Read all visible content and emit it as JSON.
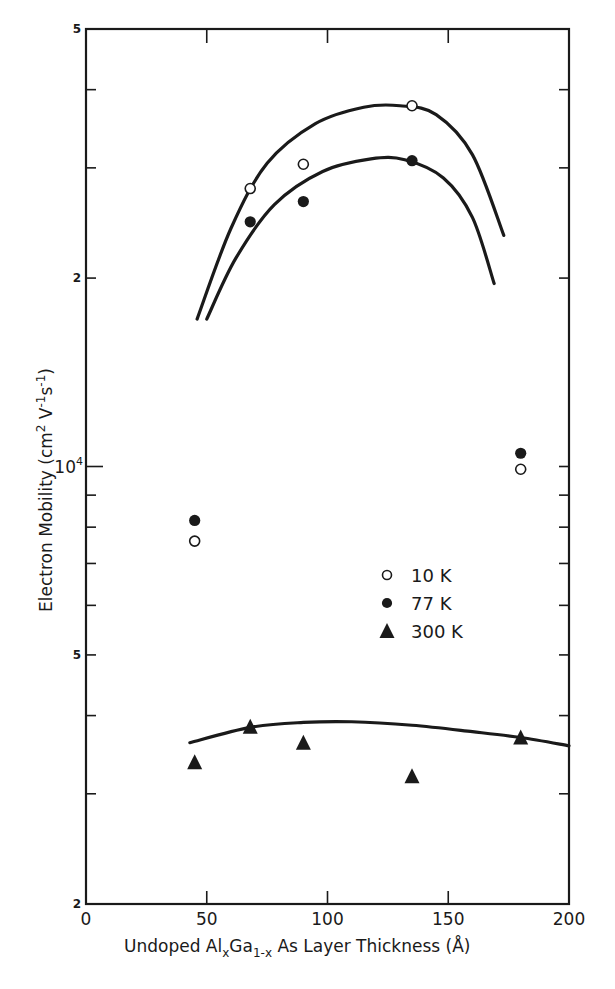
{
  "chart_data": {
    "type": "scatter",
    "title": "",
    "xlabel": "Undoped AlxGa1-x As Layer Thickness (Å)",
    "xlabel_parts": {
      "pre": "Undoped Al",
      "sub1": "x",
      "mid": "Ga",
      "sub2": "1-x",
      "post": " As Layer Thickness  (Å)"
    },
    "ylabel": "Electron Mobility (cm2 V-1s-1)",
    "ylabel_parts": {
      "pre": "Electron Mobility  (cm",
      "sup1": "2",
      "mid": " V",
      "sup2": "-1",
      "mid2": "s",
      "sup3": "-1",
      "post": ")"
    },
    "xlim": [
      0,
      200
    ],
    "ylim": [
      2000,
      50000
    ],
    "yscale": "log",
    "grid": false,
    "legend_position": "center-right",
    "x_ticks": [
      {
        "value": 0,
        "label": "0"
      },
      {
        "value": 50,
        "label": "50"
      },
      {
        "value": 100,
        "label": "100"
      },
      {
        "value": 150,
        "label": "150"
      },
      {
        "value": 200,
        "label": "200"
      }
    ],
    "y_ticks_labeled": [
      {
        "value": 50000,
        "label": "5"
      },
      {
        "value": 20000,
        "label": "2"
      },
      {
        "value": 10000,
        "label": "10",
        "sup": "4"
      },
      {
        "value": 5000,
        "label": "5"
      },
      {
        "value": 2000,
        "label": "2"
      }
    ],
    "y_minor_ticks": [
      40000,
      30000,
      9000,
      8000,
      7000,
      6000,
      4000,
      3000
    ],
    "series": [
      {
        "name": "10 K",
        "marker": "open-circle",
        "points": [
          {
            "x": 45,
            "y": 7600
          },
          {
            "x": 68,
            "y": 27800
          },
          {
            "x": 90,
            "y": 30400
          },
          {
            "x": 135,
            "y": 37700
          },
          {
            "x": 180,
            "y": 9900
          }
        ],
        "fit_curve": [
          [
            46,
            17200
          ],
          [
            60,
            24000
          ],
          [
            75,
            30500
          ],
          [
            95,
            35300
          ],
          [
            115,
            37500
          ],
          [
            130,
            37700
          ],
          [
            145,
            36500
          ],
          [
            160,
            31500
          ],
          [
            173,
            23400
          ]
        ]
      },
      {
        "name": "77 K",
        "marker": "filled-circle",
        "points": [
          {
            "x": 45,
            "y": 8200
          },
          {
            "x": 68,
            "y": 24600
          },
          {
            "x": 90,
            "y": 26500
          },
          {
            "x": 135,
            "y": 30800
          },
          {
            "x": 180,
            "y": 10500
          }
        ],
        "fit_curve": [
          [
            50,
            17200
          ],
          [
            62,
            21500
          ],
          [
            78,
            26200
          ],
          [
            98,
            29600
          ],
          [
            118,
            31000
          ],
          [
            132,
            30900
          ],
          [
            148,
            28900
          ],
          [
            160,
            25000
          ],
          [
            169,
            19600
          ]
        ]
      },
      {
        "name": "300 K",
        "marker": "filled-triangle",
        "points": [
          {
            "x": 45,
            "y": 3370
          },
          {
            "x": 68,
            "y": 3840
          },
          {
            "x": 90,
            "y": 3620
          },
          {
            "x": 135,
            "y": 3200
          },
          {
            "x": 180,
            "y": 3690
          }
        ],
        "fit_curve": [
          [
            43,
            3620
          ],
          [
            68,
            3830
          ],
          [
            90,
            3900
          ],
          [
            110,
            3910
          ],
          [
            135,
            3860
          ],
          [
            160,
            3770
          ],
          [
            180,
            3690
          ],
          [
            200,
            3580
          ]
        ]
      }
    ],
    "legend": [
      {
        "label": "10 K",
        "marker": "open-circle"
      },
      {
        "label": "77 K",
        "marker": "filled-circle"
      },
      {
        "label": "300 K",
        "marker": "filled-triangle"
      }
    ]
  }
}
